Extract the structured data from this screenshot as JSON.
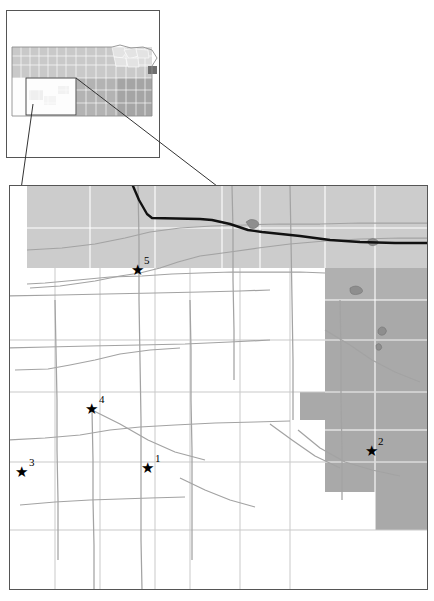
{
  "figure": {
    "type": "map",
    "background_color": "#ffffff"
  },
  "inset_map": {
    "name": "kansas-state-inset",
    "frame": {
      "x": 6,
      "y": 10,
      "width": 154,
      "height": 148,
      "border_color": "#555555"
    },
    "state_outline_color": "#999999",
    "county_line_color": "#ffffff",
    "shades": {
      "light_gray": "#cfcfcf",
      "white": "#ffffff",
      "medium_gray": "#a8a8a8",
      "mid_gray": "#bdbdbd",
      "dark_gray": "#6e6e6e"
    },
    "highlight_county": {
      "x": 151,
      "y": 69,
      "color": "#6e6e6e"
    },
    "zoom_box": {
      "x": 26,
      "y": 78,
      "width": 50,
      "height": 37
    }
  },
  "connector_lines": {
    "name": "zoom-connector-lines",
    "color": "#333333",
    "lines": [
      {
        "x1": 33,
        "y1": 104,
        "x2": 10,
        "y2": 268
      },
      {
        "x1": 76,
        "y1": 78,
        "x2": 324,
        "y2": 268
      }
    ]
  },
  "main_map": {
    "name": "county-detail-map",
    "frame": {
      "x": 9,
      "y": 185,
      "width": 419,
      "height": 405,
      "border_color": "#555555"
    },
    "fill_white": "#ffffff",
    "band_light_gray": "#cccccc",
    "region_medium_gray": "#a9a9a9",
    "road_color": "#a0a0a0",
    "county_line_color": "#ffffff",
    "boundary_line_color": "#111111",
    "boundary_line_width": 2.4
  },
  "markers": [
    {
      "id": "1",
      "label": "1",
      "star_x": 148,
      "star_y": 469,
      "label_x": 155,
      "label_y": 455
    },
    {
      "id": "2",
      "label": "2",
      "star_x": 372,
      "star_y": 452,
      "label_x": 378,
      "label_y": 438
    },
    {
      "id": "3",
      "label": "3",
      "star_x": 22,
      "star_y": 473,
      "label_x": 30,
      "label_y": 459
    },
    {
      "id": "4",
      "label": "4",
      "star_x": 92,
      "star_y": 410,
      "label_x": 100,
      "label_y": 396
    },
    {
      "id": "5",
      "label": "5",
      "star_x": 138,
      "star_y": 271,
      "label_x": 144,
      "label_y": 257
    }
  ],
  "marker_glyph": "★"
}
